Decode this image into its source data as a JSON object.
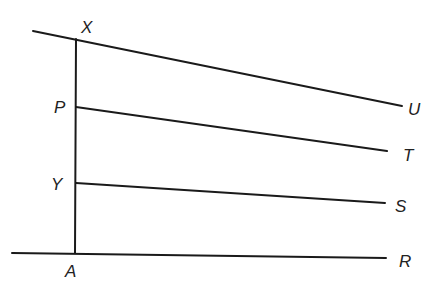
{
  "diagram": {
    "type": "geometry",
    "points": {
      "X": {
        "label": "X",
        "x": 76,
        "y": 39,
        "label_x": 81,
        "label_y": 33
      },
      "P": {
        "label": "P",
        "x": 76,
        "y": 107,
        "label_x": 54,
        "label_y": 113
      },
      "Y": {
        "label": "Y",
        "x": 76,
        "y": 183,
        "label_x": 51,
        "label_y": 190
      },
      "A": {
        "label": "A",
        "x": 75,
        "y": 253,
        "label_x": 65,
        "label_y": 277
      },
      "U": {
        "label": "U",
        "x": 402,
        "y": 106,
        "label_x": 408,
        "label_y": 115
      },
      "T": {
        "label": "T",
        "x": 387,
        "y": 151,
        "label_x": 403,
        "label_y": 161
      },
      "S": {
        "label": "S",
        "x": 385,
        "y": 203,
        "label_x": 395,
        "label_y": 212
      },
      "R": {
        "label": "R",
        "x": 386,
        "y": 258,
        "label_x": 399,
        "label_y": 267
      }
    },
    "segments": [
      {
        "name": "line-XU",
        "from": [
          33,
          31
        ],
        "to": [
          402,
          106
        ]
      },
      {
        "name": "line-XA",
        "from": [
          76,
          39
        ],
        "to": [
          75,
          253
        ]
      },
      {
        "name": "line-PT",
        "from": [
          76,
          107
        ],
        "to": [
          387,
          151
        ]
      },
      {
        "name": "line-YS",
        "from": [
          76,
          183
        ],
        "to": [
          385,
          203
        ]
      },
      {
        "name": "line-AR",
        "from": [
          12,
          253
        ],
        "to": [
          386,
          258
        ]
      }
    ],
    "labels": [
      "X",
      "P",
      "Y",
      "A",
      "U",
      "T",
      "S",
      "R"
    ],
    "stroke_color": "#1a1a1a",
    "background": "#ffffff"
  }
}
